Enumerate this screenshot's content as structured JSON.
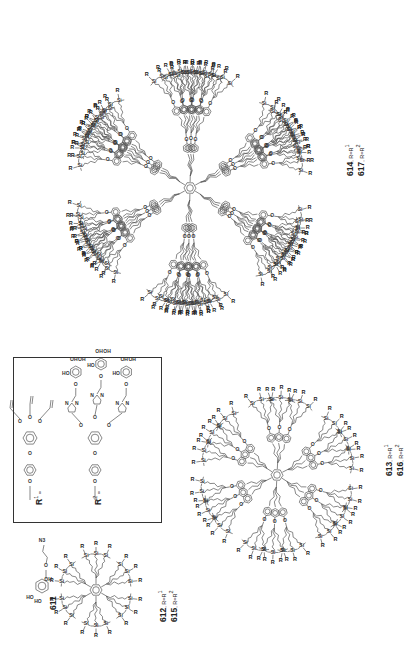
{
  "figure": {
    "orientation": "rotated 90 degrees counter-clockwise",
    "compounds": [
      {
        "id": "611",
        "label": "611",
        "description": "2-azidoethyl glycoside",
        "substituents": [
          "HO",
          "HO",
          "OH",
          "N3"
        ]
      },
      {
        "id": "612",
        "label": "612",
        "r_text": ", R=R",
        "r_sup": "1"
      },
      {
        "id": "615",
        "label": "615",
        "r_text": ", R=R",
        "r_sup": "2"
      },
      {
        "id": "613",
        "label": "613",
        "r_text": ", R=R",
        "r_sup": "1"
      },
      {
        "id": "616",
        "label": "616",
        "r_text": ", R=R",
        "r_sup": "2"
      },
      {
        "id": "614",
        "label": "614",
        "r_text": ", R=R",
        "r_sup": "1"
      },
      {
        "id": "617",
        "label": "617",
        "r_text": ", R=R",
        "r_sup": "2"
      }
    ],
    "legend_box": {
      "r1_label": "R",
      "r1_sup": "1",
      "r1_eq": " =",
      "r2_label": "R",
      "r2_sup": "2",
      "r2_eq": " =",
      "r1_groups": [
        "O",
        "O",
        "O",
        "O"
      ],
      "r2_groups": [
        "N",
        "N",
        "N",
        "HO",
        "OH",
        "OH"
      ]
    },
    "atoms": {
      "silicon": "Si",
      "terminal": "R",
      "oxygen": "O",
      "azide": "N3",
      "hydroxyl_l": "HO",
      "hydroxyl_r": "OH",
      "nitrogen": "N"
    },
    "dendrimers": [
      {
        "name": "first-generation",
        "labels": [
          "612",
          "615"
        ],
        "center": [
          96,
          590
        ],
        "arms": 6,
        "terminals_per_arm": 3
      },
      {
        "name": "second-generation",
        "labels": [
          "613",
          "616"
        ],
        "center": [
          277,
          475
        ],
        "arms": 6,
        "terminals_per_arm": 9
      },
      {
        "name": "third-generation",
        "labels": [
          "614",
          "617"
        ],
        "center": [
          190,
          188
        ],
        "arms": 6,
        "terminals_per_arm": 27
      }
    ]
  }
}
